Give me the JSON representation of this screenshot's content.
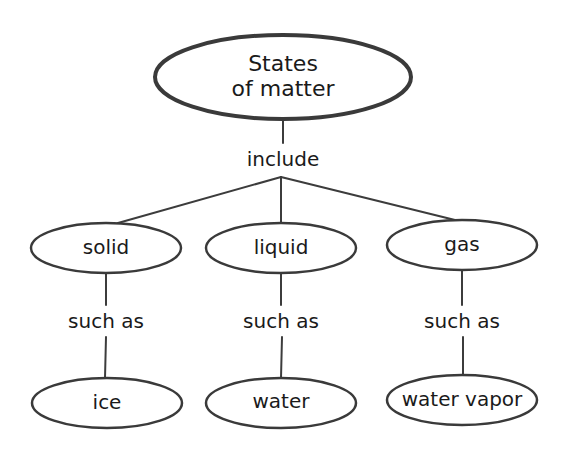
{
  "diagram": {
    "type": "concept-map",
    "root": {
      "id": "states",
      "line1": "States",
      "line2": "of matter"
    },
    "root_link": "include",
    "categories": [
      {
        "id": "solid",
        "label": "solid",
        "link": "such as",
        "example": "ice"
      },
      {
        "id": "liquid",
        "label": "liquid",
        "link": "such as",
        "example": "water"
      },
      {
        "id": "gas",
        "label": "gas",
        "link": "such as",
        "example": "water vapor"
      }
    ],
    "colors": {
      "stroke": "#3a3a3a",
      "text": "#1a1a1a",
      "background": "#ffffff"
    }
  }
}
